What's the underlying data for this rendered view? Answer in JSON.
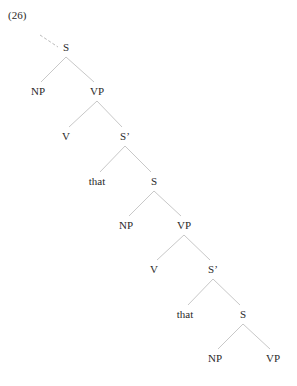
{
  "example_label": "(26)",
  "tree": {
    "nodes": [
      {
        "id": "s1",
        "label": "S"
      },
      {
        "id": "np1",
        "label": "NP"
      },
      {
        "id": "vp1",
        "label": "VP"
      },
      {
        "id": "v1",
        "label": "V"
      },
      {
        "id": "sbar1",
        "label": "S’"
      },
      {
        "id": "that1",
        "label": "that"
      },
      {
        "id": "s2",
        "label": "S"
      },
      {
        "id": "np2",
        "label": "NP"
      },
      {
        "id": "vp2",
        "label": "VP"
      },
      {
        "id": "v2",
        "label": "V"
      },
      {
        "id": "sbar2",
        "label": "S’"
      },
      {
        "id": "that2",
        "label": "that"
      },
      {
        "id": "s3",
        "label": "S"
      },
      {
        "id": "np3",
        "label": "NP"
      },
      {
        "id": "vp3",
        "label": "VP"
      }
    ],
    "edges": [
      [
        "s1",
        "np1"
      ],
      [
        "s1",
        "vp1"
      ],
      [
        "vp1",
        "v1"
      ],
      [
        "vp1",
        "sbar1"
      ],
      [
        "sbar1",
        "that1"
      ],
      [
        "sbar1",
        "s2"
      ],
      [
        "s2",
        "np2"
      ],
      [
        "s2",
        "vp2"
      ],
      [
        "vp2",
        "v2"
      ],
      [
        "vp2",
        "sbar2"
      ],
      [
        "sbar2",
        "that2"
      ],
      [
        "sbar2",
        "s3"
      ],
      [
        "s3",
        "np3"
      ],
      [
        "s3",
        "vp3"
      ]
    ],
    "root_incoming": "dashed"
  }
}
